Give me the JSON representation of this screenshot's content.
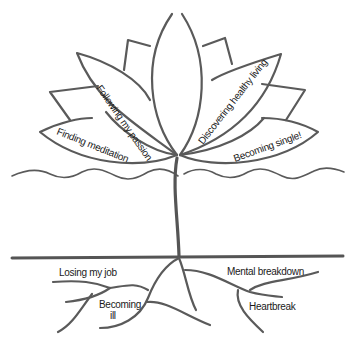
{
  "diagram": {
    "colors": {
      "stroke": "#5a5a5a",
      "text": "#1a1a1a",
      "background": "#ffffff"
    },
    "petals": {
      "upper_left": "Following my passion",
      "upper_right": "Discovering healthy living",
      "lower_left": "Finding meditation",
      "lower_right": "Becoming single!"
    },
    "roots": {
      "left_top": "Losing my job",
      "left_bottom_line1": "Becoming",
      "left_bottom_line2": "ill",
      "right_top": "Mental breakdown",
      "right_bottom": "Heartbreak"
    }
  }
}
